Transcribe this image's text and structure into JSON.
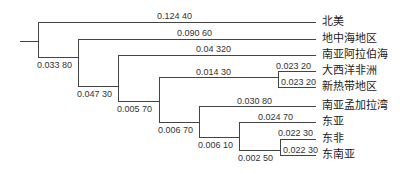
{
  "diagram": {
    "type": "phylogenetic-tree",
    "leaves": [
      {
        "name": "北美",
        "y": 22,
        "branch_label": "0.124  40",
        "label_x": 200
      },
      {
        "name": "地中海地区",
        "y": 39,
        "branch_label": "0.090  60",
        "label_x": 218
      },
      {
        "name": "南亚阿拉伯海",
        "y": 55,
        "branch_label": "0.04  320",
        "label_x": 228
      },
      {
        "name": "大西洋非洲",
        "y": 71,
        "branch_label": "0.023  20",
        "label_x": 276
      },
      {
        "name": "新热带地区",
        "y": 87,
        "branch_label": "0.023  20",
        "label_x": 281
      },
      {
        "name": "南亚孟加拉湾",
        "y": 106,
        "branch_label": "0.030  80",
        "label_x": 237
      },
      {
        "name": "东亚",
        "y": 122,
        "branch_label": "0.024  70",
        "label_x": 258
      },
      {
        "name": "东非",
        "y": 139,
        "branch_label": "0.022  30",
        "label_x": 278
      },
      {
        "name": "东南亚",
        "y": 155,
        "branch_label": "0.022  30",
        "label_x": 283
      }
    ],
    "internal_nodes": [
      {
        "label": "0.033  80"
      },
      {
        "label": "0.047  30"
      },
      {
        "label": "0.005  70"
      },
      {
        "label": "0.014  30"
      },
      {
        "label": "0.006  70"
      },
      {
        "label": "0.006  10"
      },
      {
        "label": "0.002  50"
      }
    ]
  }
}
